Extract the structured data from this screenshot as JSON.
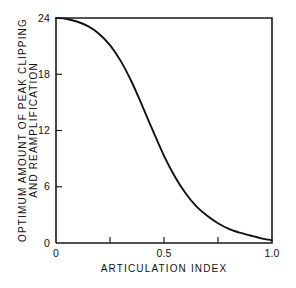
{
  "chart_data": {
    "type": "line",
    "title": "",
    "xlabel": "ARTICULATION INDEX",
    "ylabel": "OPTIMUM AMOUNT OF PEAK CLIPPING AND REAMPLIFICATION",
    "ylabel_line1": "OPTIMUM AMOUNT OF PEAK CLIPPING",
    "ylabel_line2": "AND REAMPLIFICATION",
    "xlim": [
      0,
      1.0
    ],
    "ylim": [
      0,
      24
    ],
    "xticks": [
      "0",
      "0.5",
      "1.0"
    ],
    "xtick_values": [
      0,
      0.5,
      1.0
    ],
    "xminor_tick_values": [
      0.25,
      0.75
    ],
    "yticks": [
      "0",
      "6",
      "12",
      "18",
      "24"
    ],
    "ytick_values": [
      0,
      6,
      12,
      18,
      24
    ],
    "grid": false,
    "legend": null,
    "series": [
      {
        "name": "Optimum peak clipping",
        "x": [
          0.0,
          0.05,
          0.1,
          0.15,
          0.2,
          0.25,
          0.3,
          0.35,
          0.4,
          0.45,
          0.5,
          0.55,
          0.6,
          0.65,
          0.7,
          0.75,
          0.8,
          0.85,
          0.9,
          0.95,
          1.0
        ],
        "values": [
          24.0,
          23.9,
          23.6,
          23.1,
          22.3,
          21.1,
          19.4,
          17.2,
          14.6,
          11.9,
          9.3,
          7.1,
          5.3,
          3.9,
          2.9,
          2.1,
          1.5,
          1.1,
          0.8,
          0.5,
          0.3
        ]
      }
    ],
    "colors": {
      "curve": "#121212",
      "axis": "#1a1a1a",
      "background": "#ffffff",
      "text": "#111111"
    }
  },
  "figure": {
    "caption": ""
  }
}
